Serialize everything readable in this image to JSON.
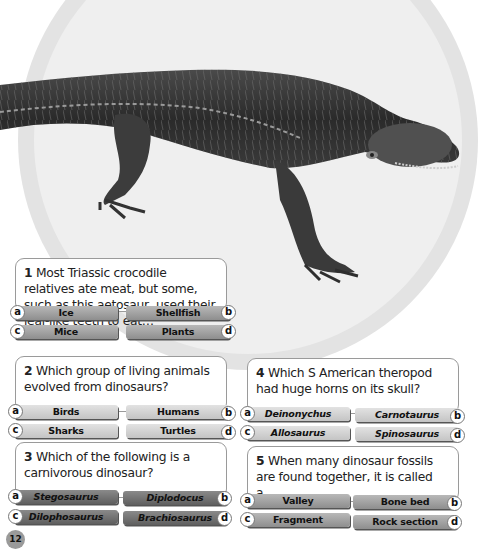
{
  "page": {
    "number": "12"
  },
  "illustration": {
    "subject": "aetosaur-crocodile-relative"
  },
  "questions": [
    {
      "number": "1",
      "text": "Most Triassic crocodile relatives ate meat, but some, such as this aetosaur, used their leaf-like teeth to eat…",
      "options": [
        {
          "letter": "a",
          "label": "Ice"
        },
        {
          "letter": "b",
          "label": "Shellfish"
        },
        {
          "letter": "c",
          "label": "Mice"
        },
        {
          "letter": "d",
          "label": "Plants"
        }
      ]
    },
    {
      "number": "2",
      "text": "Which group of living animals evolved from dinosaurs?",
      "options": [
        {
          "letter": "a",
          "label": "Birds"
        },
        {
          "letter": "b",
          "label": "Humans"
        },
        {
          "letter": "c",
          "label": "Sharks"
        },
        {
          "letter": "d",
          "label": "Turtles"
        }
      ]
    },
    {
      "number": "3",
      "text": "Which of the following is a carnivorous dinosaur?",
      "options": [
        {
          "letter": "a",
          "label": "Stegosaurus"
        },
        {
          "letter": "b",
          "label": "Diplodocus"
        },
        {
          "letter": "c",
          "label": "Dilophosaurus"
        },
        {
          "letter": "d",
          "label": "Brachiosaurus"
        }
      ]
    },
    {
      "number": "4",
      "text": "Which S American theropod had huge horns on its skull?",
      "options": [
        {
          "letter": "a",
          "label": "Deinonychus"
        },
        {
          "letter": "b",
          "label": "Carnotaurus"
        },
        {
          "letter": "c",
          "label": "Allosaurus"
        },
        {
          "letter": "d",
          "label": "Spinosaurus"
        }
      ]
    },
    {
      "number": "5",
      "text": "When many dinosaur fossils are found together, it is called a…",
      "options": [
        {
          "letter": "a",
          "label": "Valley"
        },
        {
          "letter": "b",
          "label": "Bone bed"
        },
        {
          "letter": "c",
          "label": "Fragment"
        },
        {
          "letter": "d",
          "label": "Rock section"
        }
      ]
    }
  ]
}
